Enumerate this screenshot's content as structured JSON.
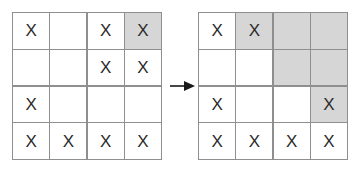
{
  "figure": {
    "name": "grid-transformation-figure",
    "mark_symbol": "X",
    "empty_symbol": "",
    "arrow": {
      "icon": "arrow-right-icon",
      "direction": "right",
      "color": "#1a1a1a"
    },
    "colors": {
      "shaded_cell": "#d6d6d6",
      "empty_cell": "#ffffff",
      "grid_line": "#8f8f8f",
      "mark_color": "#2b2b2b",
      "background": "#ffffff"
    }
  },
  "grids": [
    {
      "name": "left-grid",
      "label": "before",
      "rows": 4,
      "cols": 4,
      "cells": [
        [
          {
            "mark": "X",
            "shaded": false
          },
          {
            "mark": "",
            "shaded": false
          },
          {
            "mark": "X",
            "shaded": false
          },
          {
            "mark": "X",
            "shaded": true
          }
        ],
        [
          {
            "mark": "",
            "shaded": false
          },
          {
            "mark": "",
            "shaded": false
          },
          {
            "mark": "X",
            "shaded": false
          },
          {
            "mark": "X",
            "shaded": false
          }
        ],
        [
          {
            "mark": "X",
            "shaded": false
          },
          {
            "mark": "",
            "shaded": false
          },
          {
            "mark": "",
            "shaded": false
          },
          {
            "mark": "",
            "shaded": false
          }
        ],
        [
          {
            "mark": "X",
            "shaded": false
          },
          {
            "mark": "X",
            "shaded": false
          },
          {
            "mark": "X",
            "shaded": false
          },
          {
            "mark": "X",
            "shaded": false
          }
        ]
      ]
    },
    {
      "name": "right-grid",
      "label": "after",
      "rows": 4,
      "cols": 4,
      "cells": [
        [
          {
            "mark": "X",
            "shaded": false
          },
          {
            "mark": "X",
            "shaded": true
          },
          {
            "mark": "",
            "shaded": true
          },
          {
            "mark": "",
            "shaded": true
          }
        ],
        [
          {
            "mark": "",
            "shaded": false
          },
          {
            "mark": "",
            "shaded": false
          },
          {
            "mark": "",
            "shaded": true
          },
          {
            "mark": "",
            "shaded": true
          }
        ],
        [
          {
            "mark": "X",
            "shaded": false
          },
          {
            "mark": "",
            "shaded": false
          },
          {
            "mark": "",
            "shaded": false
          },
          {
            "mark": "X",
            "shaded": true
          }
        ],
        [
          {
            "mark": "X",
            "shaded": false
          },
          {
            "mark": "X",
            "shaded": false
          },
          {
            "mark": "X",
            "shaded": false
          },
          {
            "mark": "X",
            "shaded": false
          }
        ]
      ]
    }
  ]
}
